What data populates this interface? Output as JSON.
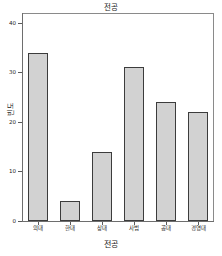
{
  "chart_data": {
    "type": "bar",
    "title": "전공",
    "xlabel": "전공",
    "ylabel": "빈도",
    "categories": [
      "의대",
      "한대",
      "상대",
      "사범",
      "공대",
      "경영대"
    ],
    "values": [
      34,
      4,
      14,
      31,
      24,
      22
    ],
    "ylim": [
      0,
      42
    ],
    "yticks": [
      0,
      10,
      20,
      30,
      40
    ],
    "ytick_labels": [
      "0",
      "10",
      "20",
      "30",
      "40"
    ],
    "grid": false,
    "legend": false,
    "legend_position": "none",
    "bar_fill_color": "#d2d2d2",
    "bar_border_color": "#3c3c3c",
    "axis_color": "#6e6e6e",
    "background_color": "#ffffff"
  }
}
